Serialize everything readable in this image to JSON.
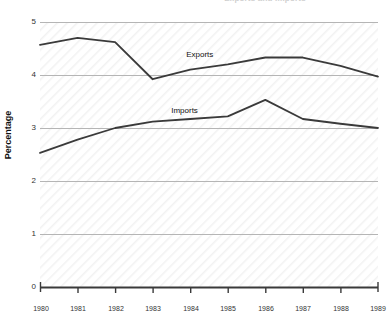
{
  "chart_data": {
    "type": "line",
    "title": "Exports and Imports",
    "xlabel": "",
    "ylabel": "Percentage",
    "categories": [
      "1980",
      "1981",
      "1982",
      "1983",
      "1984",
      "1985",
      "1986",
      "1987",
      "1988",
      "1989"
    ],
    "x": [
      1980,
      1981,
      1982,
      1983,
      1984,
      1985,
      1986,
      1987,
      1988,
      1989
    ],
    "ylim": [
      0,
      5
    ],
    "xlim": [
      1980,
      1989
    ],
    "ytick_labels": [
      "0",
      "1",
      "2",
      "3",
      "4",
      "5"
    ],
    "ytick_values": [
      0,
      1,
      2,
      3,
      4,
      5
    ],
    "grid": true,
    "grid_color": "#b8b8b8",
    "legend": "inline-labels",
    "background_pattern": "diagonal-hatch",
    "background_color": "#fbfbfb",
    "line_color": "#3a3a3a",
    "series": [
      {
        "name": "Exports",
        "values": [
          4.57,
          4.7,
          4.62,
          3.92,
          4.1,
          4.2,
          4.33,
          4.33,
          4.17,
          3.97
        ],
        "label_x": 1984.0,
        "label_y": 4.38
      },
      {
        "name": "Imports",
        "values": [
          2.53,
          2.78,
          3.0,
          3.12,
          3.17,
          3.22,
          3.53,
          3.17,
          3.08,
          3.0
        ],
        "label_x": 1983.6,
        "label_y": 3.32
      }
    ]
  },
  "axis": {
    "y_title": "Percentage",
    "y_ticks": [
      "5",
      "4",
      "3",
      "2",
      "1",
      "0"
    ],
    "x_ticks": [
      "1980",
      "1981",
      "1982",
      "1983",
      "1984",
      "1985",
      "1986",
      "1987",
      "1988",
      "1989"
    ]
  },
  "labels": {
    "exports": "Exports",
    "imports": "Imports"
  },
  "title": {
    "text": "Exports and Imports"
  }
}
